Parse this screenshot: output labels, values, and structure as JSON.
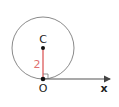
{
  "diagram": {
    "type": "geometry",
    "colors": {
      "circle": "#8a8a8a",
      "radius": "#e07070",
      "axis": "#555555",
      "point": "#111111",
      "label": "#222222",
      "radius_label": "#e07070"
    },
    "points": {
      "C": {
        "label": "C"
      },
      "O": {
        "label": "O"
      }
    },
    "axis": {
      "label": "x"
    },
    "radius": {
      "label": "2",
      "value": 2
    },
    "right_angle_marker": true
  }
}
